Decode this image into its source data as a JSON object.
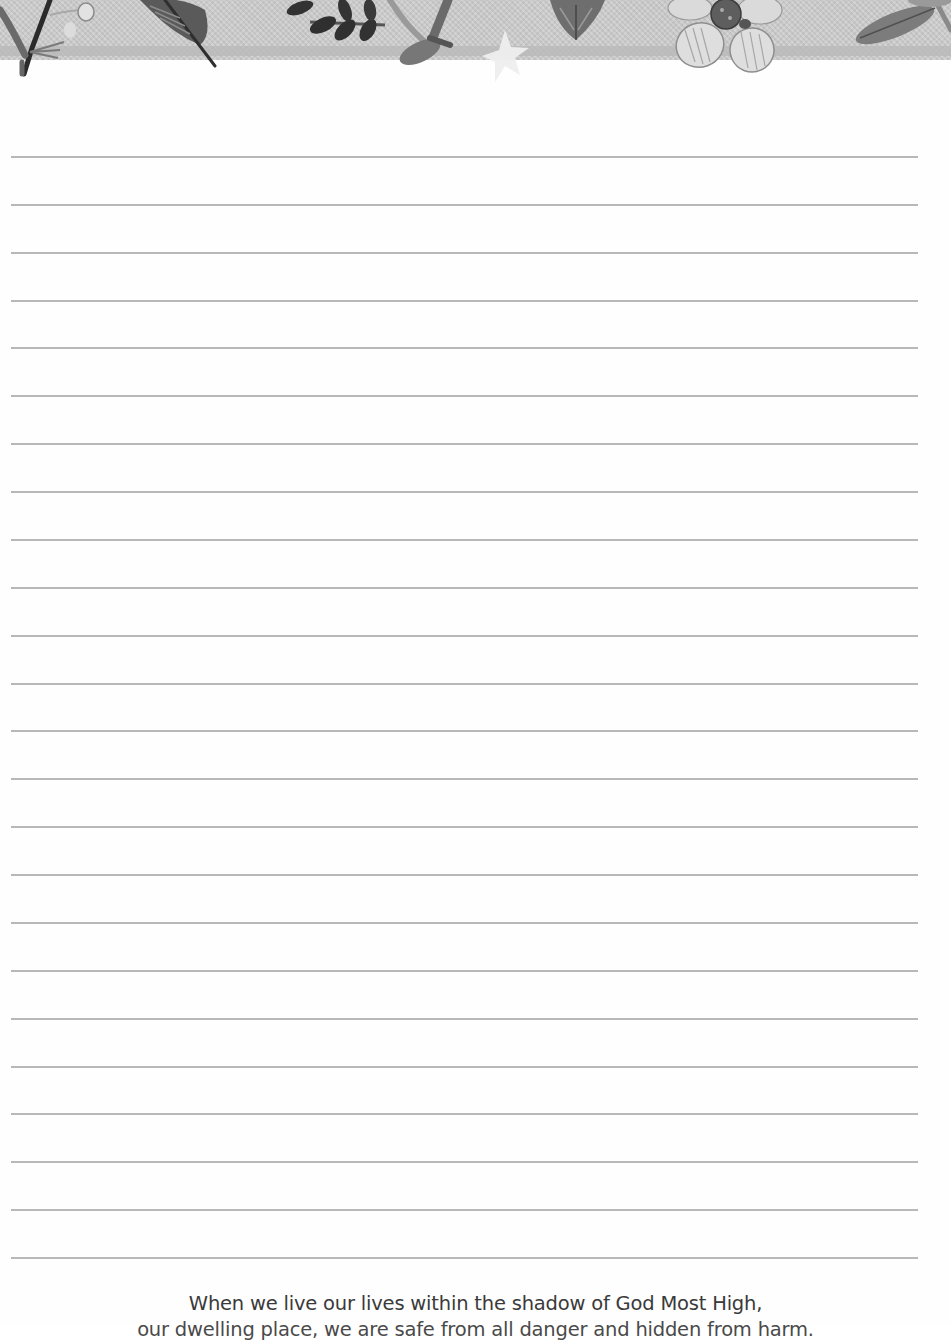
{
  "page": {
    "type": "lined-journal-page",
    "background": "#ffffff"
  },
  "header": {
    "decoration": "botanical-border",
    "band_color": "#cdcdcd",
    "stripe_color": "#b9b9b9",
    "elements": [
      {
        "icon": "fern-sprig-icon"
      },
      {
        "icon": "berry-branch-icon"
      },
      {
        "icon": "leaf-icon"
      },
      {
        "icon": "vine-leaves-icon"
      },
      {
        "icon": "branch-icon"
      },
      {
        "icon": "star-icon"
      },
      {
        "icon": "heart-leaf-icon"
      },
      {
        "icon": "flower-icon"
      },
      {
        "icon": "leaf-sprig-icon"
      }
    ]
  },
  "ruled_lines": {
    "count": 24,
    "first_y": 157,
    "spacing": 47.87,
    "left": 11,
    "right": 918,
    "color": "#b8b8b8"
  },
  "footer": {
    "quote_line1": "When we live our lives within the shadow of God Most High,",
    "quote_line2": "our dwelling place, we are safe from all danger and hidden from harm."
  }
}
